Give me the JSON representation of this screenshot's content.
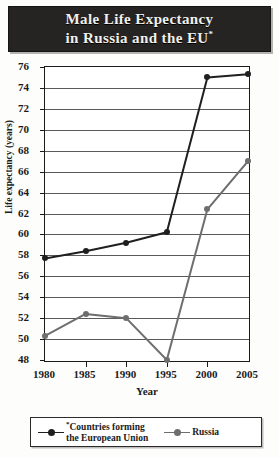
{
  "title": {
    "line1": "Male Life Expectancy",
    "line2": "in Russia and the EU",
    "asterisk": "*"
  },
  "axes": {
    "xlabel": "Year",
    "ylabel": "Life expectancy (years)",
    "yticks": [
      "76",
      "74",
      "72",
      "70",
      "68",
      "66",
      "64",
      "62",
      "60",
      "58",
      "56",
      "54",
      "52",
      "50",
      "48"
    ],
    "xticks": [
      "1980",
      "1985",
      "1990",
      "1995",
      "2000",
      "2005"
    ]
  },
  "legend": {
    "eu_asterisk": "*",
    "eu_line1": "Countries forming",
    "eu_line2": "the European Union",
    "russia": "Russia"
  },
  "colors": {
    "eu": "#1f1f1f",
    "russia": "#6e6e6e",
    "banner": "#262422",
    "banner_text": "#f2f0ec",
    "grid": "#5a5a5a",
    "frame": "#1a1a1a"
  },
  "chart_data": {
    "type": "line",
    "title": "Male Life Expectancy in Russia and the EU*",
    "xlabel": "Year",
    "ylabel": "Life expectancy (years)",
    "x": [
      1980,
      1985,
      1990,
      1995,
      2000,
      2005
    ],
    "xlim": [
      1980,
      2005
    ],
    "ylim": [
      48,
      76
    ],
    "ytick_step": 2,
    "grid": "horizontal",
    "legend_position": "bottom",
    "series": [
      {
        "name": "*Countries forming the European Union",
        "short_name": "EU",
        "color": "#1f1f1f",
        "values": [
          57.7,
          58.4,
          59.2,
          60.2,
          75.0,
          75.3
        ]
      },
      {
        "name": "Russia",
        "short_name": "Russia",
        "color": "#6e6e6e",
        "values": [
          50.3,
          52.4,
          52.0,
          48.0,
          62.4,
          67.0
        ]
      }
    ],
    "annotations": [
      "* Countries forming the European Union"
    ]
  }
}
